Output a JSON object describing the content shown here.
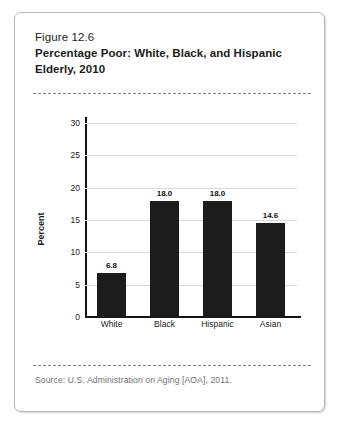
{
  "figure": {
    "number": "Figure 12.6",
    "title": "Percentage Poor: White, Black, and Hispanic Elderly, 2010",
    "source": "Source: U.S. Administration on Aging [AOA], 2011."
  },
  "chart_data": {
    "type": "bar",
    "title": "Percentage Poor: White, Black, and Hispanic Elderly, 2010",
    "categories": [
      "White",
      "Black",
      "Hispanic",
      "Asian"
    ],
    "values": [
      6.8,
      18.0,
      18.0,
      14.6
    ],
    "value_labels": [
      "6.8",
      "18.0",
      "18.0",
      "14.6"
    ],
    "xlabel": "",
    "ylabel": "Percent",
    "ylim": [
      0,
      30
    ],
    "ytick_values": [
      0,
      5,
      10,
      15,
      20,
      25,
      30
    ],
    "ytick_labels": [
      "0",
      "5",
      "10",
      "15",
      "20",
      "25",
      "30"
    ],
    "grid": true,
    "legend": "none",
    "bar_color": "#1c1c1c",
    "gridline_color": "#d8d8d8",
    "axis_color": "#141414"
  }
}
